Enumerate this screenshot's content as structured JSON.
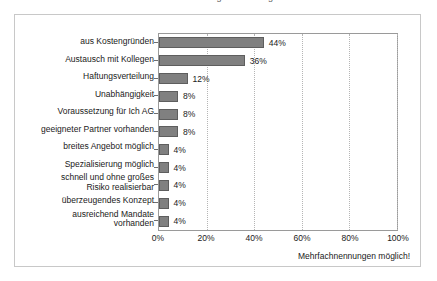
{
  "title_strip": {
    "cropped_title": "Abb. Gründe für die Gründung einer Bürogemeinschaft"
  },
  "footnote": "Mehrfachnennungen möglich!",
  "colors": {
    "bar_fill": "#808080",
    "bar_border": "#5e5e5e",
    "plot_border": "#9a9a9a",
    "frame_border": "#c8c8c8",
    "gridline": "#b5b5b5",
    "text": "#1a1a1a",
    "background": "#ffffff"
  },
  "chart_data": {
    "type": "bar",
    "orientation": "horizontal",
    "title": "",
    "xlabel": "",
    "ylabel": "",
    "xlim": [
      0,
      100
    ],
    "grid": true,
    "grid_axis": "x",
    "legend": false,
    "annotation": "Mehrfachnennungen möglich!",
    "tick_labels": [
      "0%",
      "20%",
      "40%",
      "60%",
      "80%",
      "100%"
    ],
    "ticks": [
      0,
      20,
      40,
      60,
      80,
      100
    ],
    "categories": [
      "aus Kostengründen",
      "Austausch mit Kollegen",
      "Haftungsverteilung",
      "Unabhängigkeit",
      "Voraussetzung für Ich AG",
      "geeigneter Partner vorhanden",
      "breites Angebot möglich",
      "Spezialisierung möglich",
      "schnell und ohne großes\nRisiko realisierbar",
      "überzeugendes Konzept",
      "ausreichend Mandate\nvorhanden"
    ],
    "values": [
      44,
      36,
      12,
      8,
      8,
      8,
      4,
      4,
      4,
      4,
      4
    ],
    "value_labels": [
      "44%",
      "36%",
      "12%",
      "8%",
      "8%",
      "8%",
      "4%",
      "4%",
      "4%",
      "4%",
      "4%"
    ]
  }
}
